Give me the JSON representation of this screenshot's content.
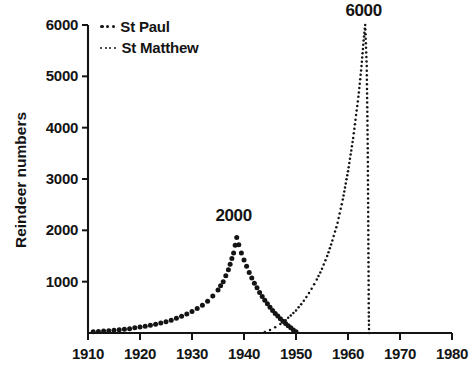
{
  "chart_data": {
    "type": "scatter",
    "title": "",
    "xlabel": "",
    "ylabel": "Reindeer numbers",
    "xlim": [
      1910,
      1980
    ],
    "ylim": [
      0,
      6000
    ],
    "grid": false,
    "legend_position": "top-left",
    "x_ticks": [
      "1910",
      "1920",
      "1930",
      "1940",
      "1950",
      "1960",
      "1970",
      "1980"
    ],
    "x_tick_values": [
      1910,
      1920,
      1930,
      1940,
      1950,
      1960,
      1970,
      1980
    ],
    "y_ticks": [
      "1000",
      "2000",
      "3000",
      "4000",
      "5000",
      "6000"
    ],
    "y_tick_values": [
      1000,
      2000,
      3000,
      4000,
      5000,
      6000
    ],
    "annotations": [
      {
        "text": "2000",
        "x": 1938,
        "y": 2000,
        "note": "St Paul peak value"
      },
      {
        "text": "6000",
        "x": 1963,
        "y": 6000,
        "note": "St Matthew peak value"
      }
    ],
    "series": [
      {
        "name": "St Paul",
        "marker": "bold-dot",
        "color": "#141414",
        "points": [
          [
            1911,
            25
          ],
          [
            1912,
            30
          ],
          [
            1913,
            38
          ],
          [
            1914,
            45
          ],
          [
            1915,
            52
          ],
          [
            1916,
            62
          ],
          [
            1917,
            72
          ],
          [
            1918,
            85
          ],
          [
            1919,
            100
          ],
          [
            1920,
            115
          ],
          [
            1921,
            130
          ],
          [
            1922,
            150
          ],
          [
            1923,
            170
          ],
          [
            1924,
            195
          ],
          [
            1925,
            220
          ],
          [
            1926,
            250
          ],
          [
            1927,
            285
          ],
          [
            1928,
            325
          ],
          [
            1929,
            370
          ],
          [
            1930,
            420
          ],
          [
            1931,
            475
          ],
          [
            1932,
            540
          ],
          [
            1933,
            620
          ],
          [
            1934,
            720
          ],
          [
            1935,
            840
          ],
          [
            1936,
            1000
          ],
          [
            1937,
            1230
          ],
          [
            1938,
            1560
          ],
          [
            1938.6,
            1860
          ],
          [
            1939,
            1720
          ],
          [
            1939.5,
            1560
          ],
          [
            1940,
            1420
          ],
          [
            1940.5,
            1300
          ],
          [
            1941,
            1180
          ],
          [
            1941.5,
            1070
          ],
          [
            1942,
            970
          ],
          [
            1942.5,
            880
          ],
          [
            1943,
            790
          ],
          [
            1943.5,
            710
          ],
          [
            1944,
            640
          ],
          [
            1944.5,
            570
          ],
          [
            1945,
            500
          ],
          [
            1945.5,
            440
          ],
          [
            1946,
            380
          ],
          [
            1946.5,
            330
          ],
          [
            1947,
            280
          ],
          [
            1947.5,
            230
          ],
          [
            1948,
            185
          ],
          [
            1948.5,
            140
          ],
          [
            1949,
            100
          ],
          [
            1949.5,
            60
          ],
          [
            1950,
            25
          ]
        ]
      },
      {
        "name": "St Matthew",
        "marker": "fine-dot",
        "color": "#141414",
        "points": [
          [
            1944,
            20
          ],
          [
            1945,
            60
          ],
          [
            1946,
            110
          ],
          [
            1947,
            175
          ],
          [
            1948,
            250
          ],
          [
            1949,
            340
          ],
          [
            1950,
            440
          ],
          [
            1951,
            560
          ],
          [
            1952,
            700
          ],
          [
            1953,
            860
          ],
          [
            1954,
            1040
          ],
          [
            1955,
            1250
          ],
          [
            1956,
            1500
          ],
          [
            1957,
            1800
          ],
          [
            1958,
            2150
          ],
          [
            1959,
            2600
          ],
          [
            1960,
            3150
          ],
          [
            1961,
            3800
          ],
          [
            1962,
            4600
          ],
          [
            1962.6,
            5200
          ],
          [
            1963,
            5700
          ],
          [
            1963.3,
            6000
          ],
          [
            1963.6,
            5200
          ],
          [
            1963.7,
            4400
          ],
          [
            1963.8,
            3600
          ],
          [
            1963.85,
            2800
          ],
          [
            1963.9,
            2000
          ],
          [
            1963.95,
            1200
          ],
          [
            1964,
            400
          ],
          [
            1964.05,
            0
          ]
        ]
      }
    ]
  },
  "legend": {
    "entries": [
      {
        "label": "St Paul",
        "marker": "bold-dot"
      },
      {
        "label": "St Matthew",
        "marker": "fine-dot"
      }
    ]
  },
  "axes": {
    "y_title": "Reindeer numbers"
  }
}
